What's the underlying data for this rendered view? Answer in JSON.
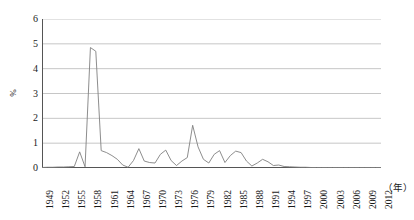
{
  "chart_data": {
    "type": "line",
    "title": "",
    "subtitle": "",
    "xlabel": "（年）",
    "ylabel": "%",
    "ylim": [
      0,
      6
    ],
    "xlim": [
      1949,
      2012
    ],
    "grid": true,
    "legend": "none",
    "y_ticks": [
      "0",
      "1",
      "2",
      "3",
      "4",
      "5",
      "6"
    ],
    "y_tick_values": [
      0,
      1,
      2,
      3,
      4,
      5,
      6
    ],
    "x_tick_labels": [
      "1949",
      "1952",
      "1955",
      "1958",
      "1961",
      "1964",
      "1967",
      "1970",
      "1973",
      "1976",
      "1979",
      "1982",
      "1985",
      "1988",
      "1991",
      "1994",
      "1997",
      "2000",
      "2003",
      "2006",
      "2009",
      "2012"
    ],
    "x_tick_values": [
      1949,
      1952,
      1955,
      1958,
      1961,
      1964,
      1967,
      1970,
      1973,
      1976,
      1979,
      1982,
      1985,
      1988,
      1991,
      1994,
      1997,
      2000,
      2003,
      2006,
      2009,
      2012
    ],
    "series": [
      {
        "name": "",
        "color": "#808080",
        "x": [
          1949,
          1950,
          1951,
          1952,
          1953,
          1954,
          1955,
          1956,
          1957,
          1958,
          1959,
          1960,
          1961,
          1962,
          1963,
          1964,
          1965,
          1966,
          1967,
          1968,
          1969,
          1970,
          1971,
          1972,
          1973,
          1974,
          1975,
          1976,
          1977,
          1978,
          1979,
          1980,
          1981,
          1982,
          1983,
          1984,
          1985,
          1986,
          1987,
          1988,
          1989,
          1990,
          1991,
          1992,
          1993,
          1994,
          1995,
          1996,
          1997,
          1998,
          1999,
          2000,
          2001,
          2002,
          2003,
          2004,
          2005,
          2006,
          2007,
          2008,
          2009,
          2010,
          2011,
          2012
        ],
        "values": [
          0.02,
          0.03,
          0.03,
          0.04,
          0.04,
          0.05,
          0.06,
          0.65,
          0.05,
          4.85,
          4.7,
          0.7,
          0.62,
          0.5,
          0.35,
          0.12,
          0.03,
          0.3,
          0.78,
          0.28,
          0.22,
          0.2,
          0.55,
          0.72,
          0.3,
          0.1,
          0.28,
          0.42,
          1.72,
          0.85,
          0.35,
          0.2,
          0.55,
          0.7,
          0.22,
          0.5,
          0.68,
          0.62,
          0.28,
          0.08,
          0.2,
          0.35,
          0.25,
          0.1,
          0.12,
          0.06,
          0.05,
          0.04,
          0.03,
          0.03,
          0.02,
          0.02,
          0.02,
          0.02,
          0.02,
          0.02,
          0.02,
          0.02,
          0.02,
          0.02,
          0.02,
          0.02,
          0.02,
          0.02
        ]
      }
    ],
    "axis_color": "#555555",
    "grid_color": "#b8b8b8",
    "background": "#ffffff"
  },
  "axes": {
    "y_title": "%",
    "x_unit": "（年）"
  }
}
